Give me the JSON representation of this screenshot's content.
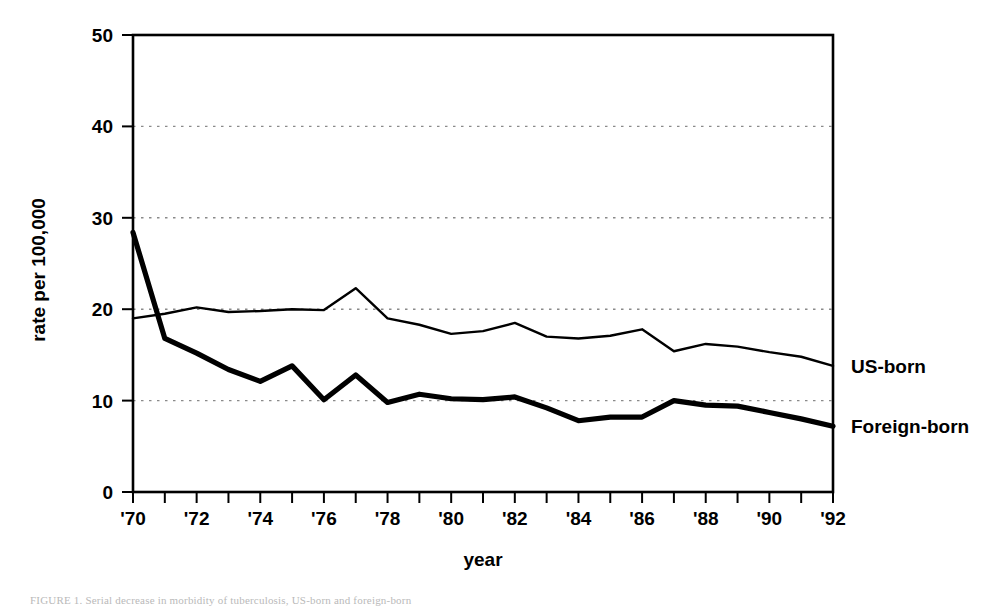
{
  "figure": {
    "caption": "FIGURE 1. Serial decrease in morbidity of tuberculosis, US-born and foreign-born",
    "legend_us_born": "US-born",
    "legend_foreign_born": "Foreign-born"
  },
  "chart_data": {
    "type": "line",
    "title": "",
    "xlabel": "year",
    "ylabel": "rate per 100,000",
    "xlim": [
      1970,
      1992
    ],
    "ylim": [
      0,
      50
    ],
    "ytick_values": [
      0,
      10,
      20,
      30,
      40,
      50
    ],
    "ytick_labels": [
      "0",
      "10",
      "20",
      "30",
      "40",
      "50"
    ],
    "xtick_values": [
      1970,
      1971,
      1972,
      1973,
      1974,
      1975,
      1976,
      1977,
      1978,
      1979,
      1980,
      1981,
      1982,
      1983,
      1984,
      1985,
      1986,
      1987,
      1988,
      1989,
      1990,
      1991,
      1992
    ],
    "xtick_labeled_values": [
      1970,
      1972,
      1974,
      1976,
      1978,
      1980,
      1982,
      1984,
      1986,
      1988,
      1990,
      1992
    ],
    "xtick_labels": [
      "'70",
      "'72",
      "'74",
      "'76",
      "'78",
      "'80",
      "'82",
      "'84",
      "'86",
      "'88",
      "'90",
      "'92"
    ],
    "grid": "horizontal-dotted",
    "gridlines": [
      10,
      20,
      30,
      40
    ],
    "legend_position": "right-inline",
    "x": [
      1970,
      1971,
      1972,
      1973,
      1974,
      1975,
      1976,
      1977,
      1978,
      1979,
      1980,
      1981,
      1982,
      1983,
      1984,
      1985,
      1986,
      1987,
      1988,
      1989,
      1990,
      1991,
      1992
    ],
    "series": [
      {
        "name": "US-born",
        "style": "thin",
        "color": "#000000",
        "values": [
          19.0,
          19.5,
          20.2,
          19.7,
          19.8,
          20.0,
          19.9,
          22.3,
          19.0,
          18.3,
          17.3,
          17.6,
          18.5,
          17.0,
          16.8,
          17.1,
          17.8,
          15.4,
          16.2,
          15.9,
          15.3,
          14.8,
          13.8
        ]
      },
      {
        "name": "Foreign-born",
        "style": "thick",
        "color": "#000000",
        "values": [
          28.4,
          16.8,
          15.2,
          13.4,
          12.1,
          13.8,
          10.1,
          12.8,
          9.8,
          10.7,
          10.2,
          10.1,
          10.4,
          9.2,
          7.8,
          8.2,
          8.2,
          10.0,
          9.5,
          9.4,
          8.7,
          8.0,
          7.2
        ]
      }
    ]
  },
  "plot_geometry": {
    "left": 133,
    "right": 833,
    "top": 35,
    "bottom": 492
  }
}
